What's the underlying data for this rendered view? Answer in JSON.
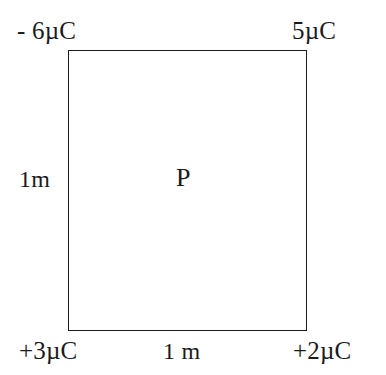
{
  "figure": {
    "type": "physics-diagram",
    "background_color": "#ffffff",
    "line_color": "#1c1c1c",
    "text_color": "#1a1a1a"
  },
  "shape": {
    "name": "square",
    "side_length_label": "1 m"
  },
  "charges": {
    "top_left": "- 6µC",
    "top_right": "5µC",
    "bottom_left": "+3µC",
    "bottom_right": "+2µC"
  },
  "dimensions": {
    "left_side": "1m",
    "bottom_side": "1 m"
  },
  "points": {
    "center": "P"
  }
}
